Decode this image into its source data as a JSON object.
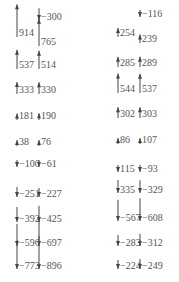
{
  "diagram": {
    "type": "vector-arrow-columns",
    "arrow_color": "#444444",
    "label_color": "#555555",
    "groups": [
      {
        "name": "left",
        "top_arrow": {
          "x": 39,
          "y": 15,
          "value": "-300",
          "label_y": 17
        },
        "columns": [
          {
            "x": 17,
            "entries": [
              {
                "value": "914",
                "y": 33
              },
              {
                "value": "537",
                "y": 65
              },
              {
                "value": "333",
                "y": 90
              },
              {
                "value": "181",
                "y": 116
              },
              {
                "value": "38",
                "y": 142
              },
              {
                "value": "-100",
                "y": 164
              },
              {
                "value": "-251",
                "y": 194
              },
              {
                "value": "-392",
                "y": 219
              },
              {
                "value": "-596",
                "y": 243
              },
              {
                "value": "-773",
                "y": 266
              }
            ]
          },
          {
            "x": 39,
            "entries": [
              {
                "value": "765",
                "y": 42
              },
              {
                "value": "514",
                "y": 65
              },
              {
                "value": "330",
                "y": 90
              },
              {
                "value": "190",
                "y": 116
              },
              {
                "value": "76",
                "y": 142
              },
              {
                "value": "-61",
                "y": 164
              },
              {
                "value": "-227",
                "y": 194
              },
              {
                "value": "-425",
                "y": 219
              },
              {
                "value": "-697",
                "y": 243
              },
              {
                "value": "-896",
                "y": 266
              }
            ]
          }
        ]
      },
      {
        "name": "right",
        "top_arrow": {
          "x": 140,
          "y": 10,
          "value": "-116",
          "label_y": 14
        },
        "columns": [
          {
            "x": 118,
            "entries": [
              {
                "value": "254",
                "y": 33
              },
              {
                "value": "285",
                "y": 63
              },
              {
                "value": "544",
                "y": 89
              },
              {
                "value": "302",
                "y": 114
              },
              {
                "value": "86",
                "y": 140
              },
              {
                "value": "115",
                "y": 169,
                "dir": "down"
              },
              {
                "value": "335",
                "y": 190,
                "dir": "down"
              },
              {
                "value": "-567",
                "y": 218
              },
              {
                "value": "-283",
                "y": 243
              },
              {
                "value": "-224",
                "y": 266
              }
            ]
          },
          {
            "x": 140,
            "entries": [
              {
                "value": "239",
                "y": 39
              },
              {
                "value": "289",
                "y": 63
              },
              {
                "value": "537",
                "y": 89
              },
              {
                "value": "303",
                "y": 114
              },
              {
                "value": "107",
                "y": 140
              },
              {
                "value": "-93",
                "y": 169
              },
              {
                "value": "-329",
                "y": 190
              },
              {
                "value": "-608",
                "y": 218
              },
              {
                "value": "-312",
                "y": 243
              },
              {
                "value": "-249",
                "y": 266
              }
            ]
          }
        ]
      }
    ]
  }
}
